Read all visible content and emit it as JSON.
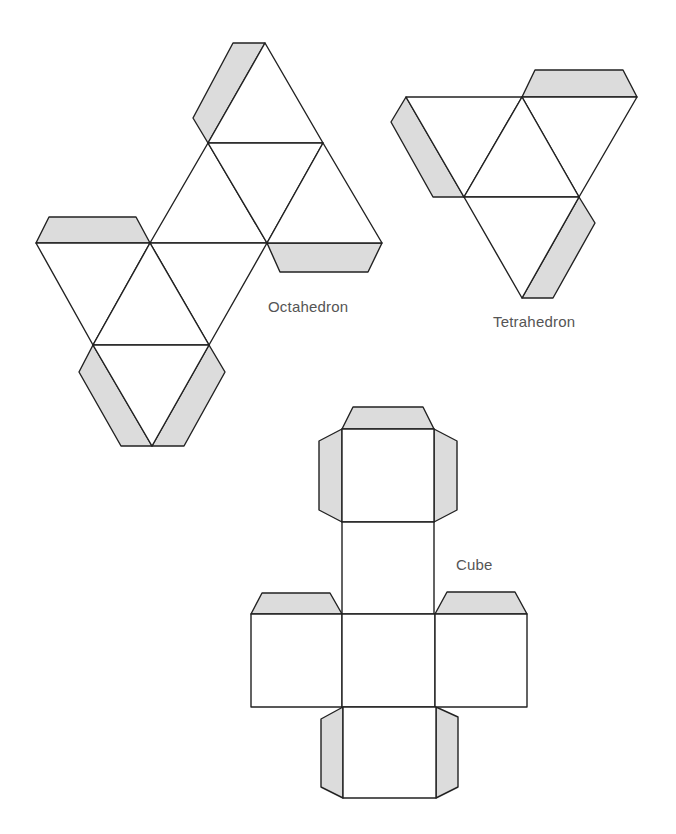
{
  "labels": {
    "octahedron": "Octahedron",
    "tetrahedron": "Tetrahedron",
    "cube": "Cube"
  },
  "colors": {
    "tab_fill": "#dcdcdc",
    "face_fill": "#ffffff",
    "stroke": "#222222",
    "label": "#555555"
  }
}
